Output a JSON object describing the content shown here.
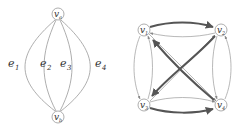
{
  "left_graph": {
    "nodes": [
      {
        "id": "va",
        "label": "v",
        "sub": "a"
      },
      {
        "id": "vb",
        "label": "v",
        "sub": "b"
      }
    ],
    "edges": [
      {
        "label": "e",
        "sub": "1"
      },
      {
        "label": "e",
        "sub": "2"
      },
      {
        "label": "e",
        "sub": "3"
      },
      {
        "label": "e",
        "sub": "4"
      }
    ]
  },
  "right_graph": {
    "nodes": [
      {
        "id": "v1",
        "label": "v",
        "sub": "1"
      },
      {
        "id": "v2",
        "label": "v",
        "sub": "2"
      },
      {
        "id": "v3",
        "label": "v",
        "sub": "3"
      },
      {
        "id": "v4",
        "label": "v",
        "sub": "4"
      }
    ],
    "heavy_arrows": [
      "v1->v2",
      "v3->v4",
      "v2->v3",
      "v4->v1"
    ],
    "colors": {
      "stroke": "#888888",
      "heavy": "#555555",
      "node_fill": "#ffffff"
    }
  }
}
